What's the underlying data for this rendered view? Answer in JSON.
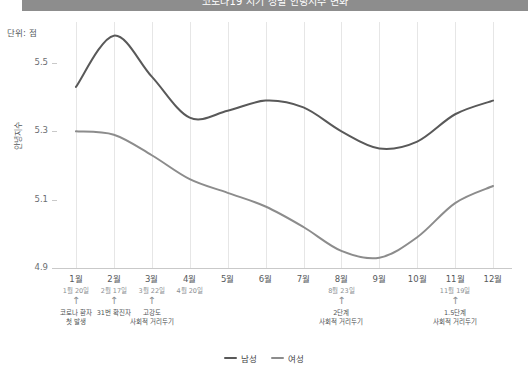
{
  "header": {
    "bar_text": "코로나19 시기 성별 안녕지수 변화"
  },
  "unit_label": "단위: 점",
  "y_axis_title": "안녕지수",
  "legend": {
    "items": [
      {
        "label": "남성",
        "color": "#595959"
      },
      {
        "label": "여성",
        "color": "#8c8c8c"
      }
    ]
  },
  "colors": {
    "male_line": "#595959",
    "female_line": "#8c8c8c",
    "gridline": "#e6e6e6",
    "axis": "#c9c9c9",
    "header_bar": "#8d8d8d",
    "text": "#55595c"
  },
  "annotations": [
    {
      "month": "1월",
      "date": "1월 20일",
      "arrow": "↑",
      "line1": "코로나 환자",
      "line2": "첫 발생"
    },
    {
      "month": "2월",
      "date": "2월 17일",
      "arrow": "↑",
      "line1": "31번 확진자",
      "line2": ""
    },
    {
      "month": "3월",
      "date": "3월 22일",
      "arrow": "↑",
      "line1": "고강도",
      "line2": "사회적 거리두기"
    },
    {
      "month": "4월",
      "date": "4월 20일",
      "arrow": "",
      "line1": "",
      "line2": ""
    },
    {
      "month": "8월",
      "date": "8월 23일",
      "arrow": "↑",
      "line1": "2단계",
      "line2": "사회적 거리두기"
    },
    {
      "month": "11월",
      "date": "11월 19일",
      "arrow": "↑",
      "line1": "1.5단계",
      "line2": "사회적 거리두기"
    }
  ],
  "chart_data": {
    "type": "line",
    "title": "코로나19 시기 성별 안녕지수 변화",
    "xlabel": "",
    "ylabel": "안녕지수",
    "unit": "점",
    "grid": "vertical",
    "legend_position": "bottom",
    "ylim": [
      4.9,
      5.62
    ],
    "yticks": [
      4.9,
      5.1,
      5.3,
      5.5
    ],
    "ytick_labels": [
      "4.9",
      "5.1",
      "5.3",
      "5.5"
    ],
    "categories": [
      "1월",
      "2월",
      "3월",
      "4월",
      "5월",
      "6월",
      "7월",
      "8월",
      "9월",
      "10월",
      "11월",
      "12월"
    ],
    "series": [
      {
        "name": "남성",
        "color": "#595959",
        "values": [
          5.43,
          5.58,
          5.46,
          5.34,
          5.36,
          5.39,
          5.37,
          5.3,
          5.25,
          5.27,
          5.35,
          5.39
        ]
      },
      {
        "name": "여성",
        "color": "#8c8c8c",
        "values": [
          5.3,
          5.29,
          5.23,
          5.16,
          5.12,
          5.08,
          5.02,
          4.95,
          4.93,
          4.99,
          5.09,
          5.14
        ]
      }
    ]
  }
}
